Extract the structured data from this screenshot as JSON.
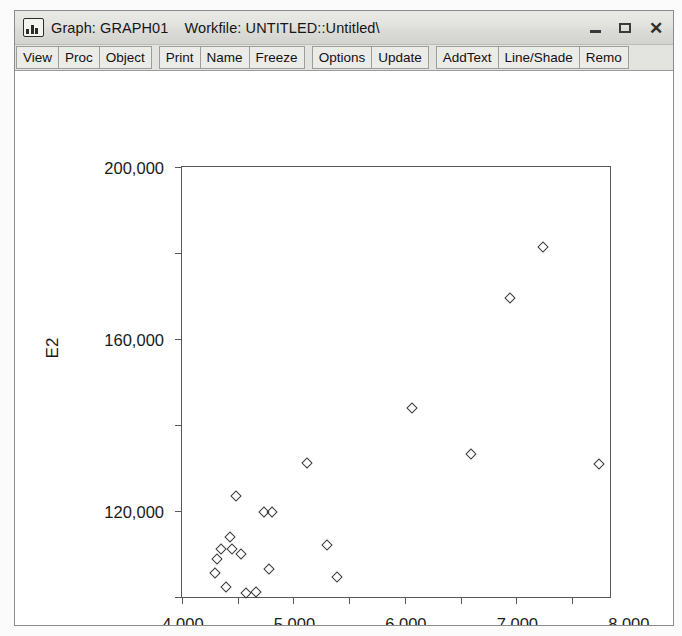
{
  "window": {
    "icon": "bar-chart-icon",
    "title_object": "Graph: GRAPH01",
    "title_workfile": "Workfile: UNTITLED::Untitled\\",
    "controls": {
      "minimize": "minimize-icon",
      "maximize": "maximize-icon",
      "close": "✕"
    }
  },
  "toolbar": {
    "groups": [
      {
        "buttons": [
          "View",
          "Proc",
          "Object"
        ]
      },
      {
        "buttons": [
          "Print",
          "Name",
          "Freeze"
        ]
      },
      {
        "buttons": [
          "Options",
          "Update"
        ]
      },
      {
        "buttons": [
          "AddText",
          "Line/Shade",
          "Remo"
        ]
      }
    ]
  },
  "chart_data": {
    "type": "scatter",
    "title": "",
    "xlabel": "X",
    "ylabel": "E2",
    "xlim": [
      4000,
      11680
    ],
    "ylim": [
      0,
      200000
    ],
    "grid": false,
    "legend": "none",
    "marker": "open-diamond",
    "xticks": [
      4000,
      5000,
      6000,
      7000,
      8000,
      9000,
      10000,
      11000
    ],
    "xticklabels": [
      "4,000",
      "5,000",
      "6,000",
      "7,000",
      "8,000",
      "9,000",
      "",
      "11,000"
    ],
    "yticks": [
      0,
      40000,
      80000,
      120000,
      160000,
      200000
    ],
    "yticklabels": [
      "0",
      "40,000",
      "80,000",
      "120,000",
      "160,000",
      "200,000"
    ],
    "points": [
      {
        "x": 4590,
        "y": 11000
      },
      {
        "x": 4620,
        "y": 17500
      },
      {
        "x": 4700,
        "y": 22500
      },
      {
        "x": 4790,
        "y": 4500
      },
      {
        "x": 4860,
        "y": 27800
      },
      {
        "x": 4900,
        "y": 22200
      },
      {
        "x": 4960,
        "y": 47000
      },
      {
        "x": 5060,
        "y": 19900
      },
      {
        "x": 5150,
        "y": 2000
      },
      {
        "x": 5330,
        "y": 2300
      },
      {
        "x": 5480,
        "y": 39500
      },
      {
        "x": 5620,
        "y": 39500
      },
      {
        "x": 5560,
        "y": 13000
      },
      {
        "x": 6250,
        "y": 62500
      },
      {
        "x": 6600,
        "y": 24000
      },
      {
        "x": 6790,
        "y": 9500
      },
      {
        "x": 8120,
        "y": 88000
      },
      {
        "x": 9180,
        "y": 66500
      },
      {
        "x": 9880,
        "y": 139000
      },
      {
        "x": 10480,
        "y": 163000
      },
      {
        "x": 11480,
        "y": 62000
      }
    ]
  }
}
